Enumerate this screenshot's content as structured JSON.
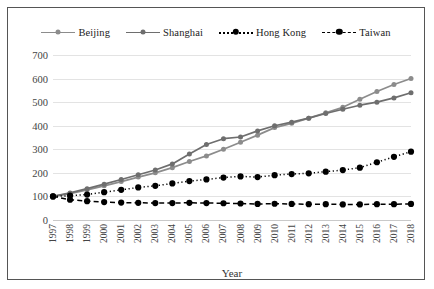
{
  "chart_data": {
    "type": "line",
    "title": "",
    "xlabel": "Year",
    "ylabel": "",
    "ylim": [
      0,
      700
    ],
    "ytick_step": 100,
    "yticks": [
      "0",
      "100",
      "200",
      "300",
      "400",
      "500",
      "600",
      "700"
    ],
    "grid": true,
    "legend_position": "top",
    "categories": [
      "1997",
      "1998",
      "1999",
      "2000",
      "2001",
      "2002",
      "2003",
      "2004",
      "2005",
      "2006",
      "2007",
      "2008",
      "2009",
      "2010",
      "2011",
      "2012",
      "2013",
      "2014",
      "2015",
      "2016",
      "2017",
      "2018"
    ],
    "series": [
      {
        "name": "Beijing",
        "color": "#8c8c8c",
        "marker": "circle",
        "line_style": "solid",
        "values": [
          100,
          112,
          128,
          145,
          163,
          182,
          200,
          222,
          248,
          272,
          300,
          330,
          360,
          392,
          410,
          432,
          455,
          478,
          512,
          545,
          575,
          600
        ]
      },
      {
        "name": "Shanghai",
        "color": "#6e6e6e",
        "marker": "circle",
        "line_style": "solid",
        "values": [
          100,
          115,
          133,
          152,
          172,
          192,
          212,
          238,
          280,
          320,
          345,
          352,
          378,
          400,
          415,
          432,
          452,
          470,
          487,
          500,
          518,
          540
        ]
      },
      {
        "name": "Hong Kong",
        "color": "#000000",
        "marker": "circle",
        "line_style": "dotted",
        "values": [
          100,
          103,
          108,
          118,
          128,
          138,
          145,
          155,
          165,
          172,
          180,
          185,
          182,
          190,
          195,
          198,
          205,
          212,
          222,
          245,
          268,
          290
        ]
      },
      {
        "name": "Taiwan",
        "color": "#000000",
        "marker": "circle",
        "line_style": "dashed",
        "values": [
          100,
          86,
          80,
          76,
          74,
          73,
          72,
          72,
          73,
          72,
          71,
          70,
          68,
          69,
          68,
          67,
          67,
          66,
          66,
          67,
          67,
          68
        ]
      }
    ]
  }
}
